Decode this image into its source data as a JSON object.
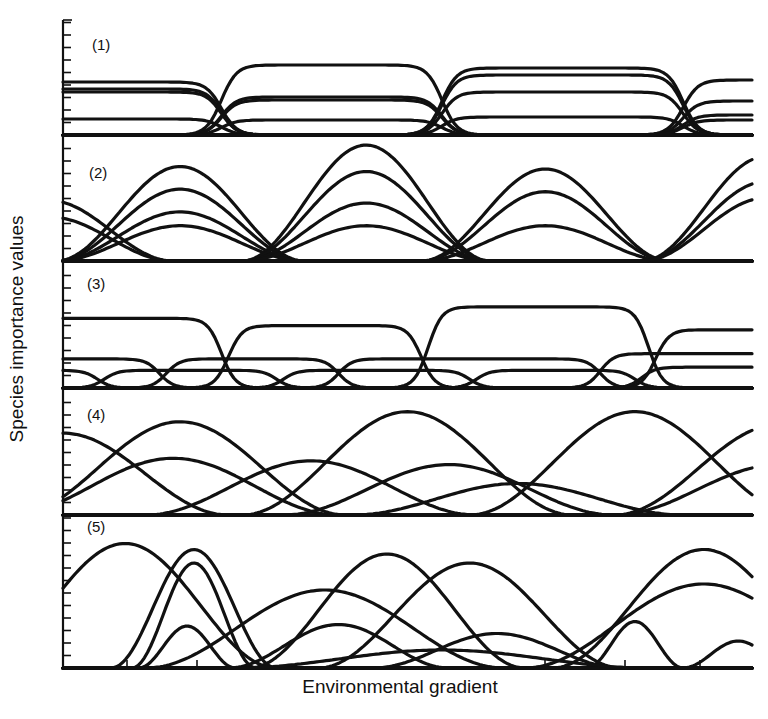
{
  "figure": {
    "ylabel": "Species importance values",
    "xlabel": "Environmental gradient",
    "panels": [
      {
        "label": "(1)"
      },
      {
        "label": "(2)"
      },
      {
        "label": "(3)"
      },
      {
        "label": "(4)"
      },
      {
        "label": "(5)"
      }
    ]
  },
  "chart_data": [
    {
      "type": "line",
      "panel": "(1)",
      "title": "(1)",
      "description": "Discrete communities with sharp boundaries; plateau-shaped species curves in four zones",
      "xlabel": "Environmental gradient",
      "ylabel": "Species importance values",
      "x_range": [
        0,
        100
      ],
      "ylim": [
        0,
        10
      ],
      "grid": false,
      "zone_boundaries_x": [
        23,
        55,
        90
      ],
      "series": [
        {
          "name": "zone1-a",
          "x_start": 0,
          "x_end": 23,
          "plateau": 5.3
        },
        {
          "name": "zone1-b",
          "x_start": 0,
          "x_end": 23,
          "plateau": 4.6
        },
        {
          "name": "zone1-c",
          "x_start": 0,
          "x_end": 23,
          "plateau": 4.3
        },
        {
          "name": "zone1-d",
          "x_start": 0,
          "x_end": 23,
          "plateau": 1.6
        },
        {
          "name": "zone2-a",
          "x_start": 23,
          "x_end": 55,
          "plateau": 7.0
        },
        {
          "name": "zone2-b",
          "x_start": 23,
          "x_end": 55,
          "plateau": 3.8
        },
        {
          "name": "zone2-c",
          "x_start": 23,
          "x_end": 55,
          "plateau": 3.5
        },
        {
          "name": "zone2-d",
          "x_start": 23,
          "x_end": 55,
          "plateau": 1.5
        },
        {
          "name": "zone3-a",
          "x_start": 55,
          "x_end": 90,
          "plateau": 6.7
        },
        {
          "name": "zone3-b",
          "x_start": 55,
          "x_end": 90,
          "plateau": 6.0
        },
        {
          "name": "zone3-c",
          "x_start": 55,
          "x_end": 90,
          "plateau": 4.3
        },
        {
          "name": "zone3-d",
          "x_start": 55,
          "x_end": 90,
          "plateau": 1.8
        },
        {
          "name": "zone4-a",
          "x_start": 90,
          "x_end": 100,
          "plateau": 5.5
        },
        {
          "name": "zone4-b",
          "x_start": 90,
          "x_end": 100,
          "plateau": 3.4
        },
        {
          "name": "zone4-c",
          "x_start": 90,
          "x_end": 100,
          "plateau": 2.0
        },
        {
          "name": "zone4-d",
          "x_start": 90,
          "x_end": 100,
          "plateau": 1.5
        }
      ]
    },
    {
      "type": "line",
      "panel": "(2)",
      "title": "(2)",
      "description": "Groups of species with bell-shaped curves sharing modes; communities grade into one another",
      "x_range": [
        0,
        100
      ],
      "ylim": [
        0,
        10
      ],
      "grid": false,
      "series": [
        {
          "name": "g1-a",
          "mode_x": -2,
          "peak": 4.8
        },
        {
          "name": "g1-b",
          "mode_x": -2,
          "peak": 3.5
        },
        {
          "name": "g2-a",
          "mode_x": 17,
          "peak": 7.5
        },
        {
          "name": "g2-b",
          "mode_x": 17,
          "peak": 5.7
        },
        {
          "name": "g2-c",
          "mode_x": 17,
          "peak": 3.9
        },
        {
          "name": "g2-d",
          "mode_x": 17,
          "peak": 2.8
        },
        {
          "name": "g3-a",
          "mode_x": 44,
          "peak": 9.2
        },
        {
          "name": "g3-b",
          "mode_x": 44,
          "peak": 7.1
        },
        {
          "name": "g3-c",
          "mode_x": 44,
          "peak": 4.6
        },
        {
          "name": "g3-d",
          "mode_x": 44,
          "peak": 2.8
        },
        {
          "name": "g4-a",
          "mode_x": 70,
          "peak": 7.3
        },
        {
          "name": "g4-b",
          "mode_x": 70,
          "peak": 5.5
        },
        {
          "name": "g4-c",
          "mode_x": 70,
          "peak": 2.8
        },
        {
          "name": "g5-a",
          "mode_x": 102,
          "peak": 8.3
        },
        {
          "name": "g5-b",
          "mode_x": 102,
          "peak": 6.3
        },
        {
          "name": "g5-c",
          "mode_x": 102,
          "peak": 5.0
        }
      ]
    },
    {
      "type": "line",
      "panel": "(3)",
      "title": "(3)",
      "description": "Species with abrupt boundaries distributed independently; plateau curves at different levels",
      "x_range": [
        0,
        100
      ],
      "ylim": [
        0,
        10
      ],
      "grid": false,
      "series": [
        {
          "name": "tall-1",
          "x_start": 0,
          "x_end": 23,
          "plateau": 6.7
        },
        {
          "name": "tall-2",
          "x_start": 24,
          "x_end": 52,
          "plateau": 6.0
        },
        {
          "name": "tall-3",
          "x_start": 53,
          "x_end": 85,
          "plateau": 7.8
        },
        {
          "name": "tall-4",
          "x_start": 86,
          "x_end": 100,
          "plateau": 5.6
        },
        {
          "name": "mid-1",
          "x_start": 0,
          "x_end": 14,
          "plateau": 2.8
        },
        {
          "name": "mid-2",
          "x_start": 15,
          "x_end": 40,
          "plateau": 2.8
        },
        {
          "name": "mid-3",
          "x_start": 40,
          "x_end": 78,
          "plateau": 2.8
        },
        {
          "name": "mid-4",
          "x_start": 78,
          "x_end": 100,
          "plateau": 3.3
        },
        {
          "name": "low-1",
          "x_start": 0,
          "x_end": 5,
          "plateau": 1.7
        },
        {
          "name": "low-2",
          "x_start": 6,
          "x_end": 31,
          "plateau": 1.7
        },
        {
          "name": "low-3",
          "x_start": 32,
          "x_end": 59,
          "plateau": 1.7
        },
        {
          "name": "low-4",
          "x_start": 60,
          "x_end": 83,
          "plateau": 1.7
        },
        {
          "name": "low-5",
          "x_start": 84,
          "x_end": 100,
          "plateau": 2.0
        }
      ]
    },
    {
      "type": "line",
      "panel": "(4)",
      "title": "(4)",
      "description": "Continuum: broad bell curves with modes scattered independently along the gradient",
      "x_range": [
        0,
        100
      ],
      "ylim": [
        0,
        10
      ],
      "grid": false,
      "series": [
        {
          "name": "sp-a",
          "mode_x": 0,
          "peak": 6.5
        },
        {
          "name": "sp-b",
          "mode_x": 17,
          "peak": 7.4
        },
        {
          "name": "sp-c",
          "mode_x": 16,
          "peak": 4.5
        },
        {
          "name": "sp-d",
          "mode_x": 36,
          "peak": 4.3
        },
        {
          "name": "sp-e",
          "mode_x": 50,
          "peak": 8.2
        },
        {
          "name": "sp-f",
          "mode_x": 56,
          "peak": 4.0
        },
        {
          "name": "sp-g",
          "mode_x": 83,
          "peak": 8.2
        },
        {
          "name": "sp-h",
          "mode_x": 104,
          "peak": 7.2
        },
        {
          "name": "sp-i",
          "mode_x": 104,
          "peak": 4.0
        },
        {
          "name": "sp-j",
          "mode_x": 66,
          "peak": 2.5
        }
      ]
    },
    {
      "type": "line",
      "panel": "(5)",
      "title": "(5)",
      "description": "Continuum with varied curve widths and heights, irregularly scattered",
      "x_range": [
        0,
        100
      ],
      "ylim": [
        0,
        10
      ],
      "grid": false,
      "series": [
        {
          "name": "s1",
          "mode_x": 9,
          "peak": 8.3
        },
        {
          "name": "s2",
          "mode_x": 19,
          "peak": 7.9
        },
        {
          "name": "s3",
          "mode_x": 19,
          "peak": 7.0
        },
        {
          "name": "s4",
          "mode_x": 18,
          "peak": 2.8
        },
        {
          "name": "s5",
          "mode_x": 47,
          "peak": 7.6
        },
        {
          "name": "s6",
          "mode_x": 38,
          "peak": 5.2
        },
        {
          "name": "s7",
          "mode_x": 59,
          "peak": 7.0
        },
        {
          "name": "s8",
          "mode_x": 40,
          "peak": 2.9
        },
        {
          "name": "s9",
          "mode_x": 93,
          "peak": 7.9
        },
        {
          "name": "s10",
          "mode_x": 93,
          "peak": 5.6
        },
        {
          "name": "s11",
          "mode_x": 83,
          "peak": 3.1
        },
        {
          "name": "s12",
          "mode_x": 98,
          "peak": 1.8
        },
        {
          "name": "s13",
          "mode_x": 63,
          "peak": 2.3
        },
        {
          "name": "s14",
          "mode_x": 55,
          "peak": 1.2
        }
      ]
    }
  ]
}
